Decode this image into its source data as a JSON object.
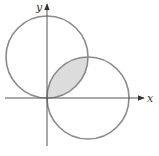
{
  "figure": {
    "axes": {
      "x_label": "x",
      "y_label": "y"
    },
    "circles": [
      {
        "name": "upper-circle",
        "center": [
          0,
          1
        ],
        "radius": 1,
        "equation": "x^2 + (y - a)^2 = a^2"
      },
      {
        "name": "right-circle",
        "center": [
          1,
          0
        ],
        "radius": 1,
        "equation": "(x - a)^2 + y^2 = a^2"
      }
    ],
    "intersection_points": [
      [
        0,
        0
      ],
      [
        1,
        1
      ]
    ],
    "shaded_region": "intersection of the two circles",
    "colors": {
      "circle_stroke": "#8a8a8a",
      "shade_fill": "#dcdcdc",
      "axis": "#555555"
    }
  }
}
